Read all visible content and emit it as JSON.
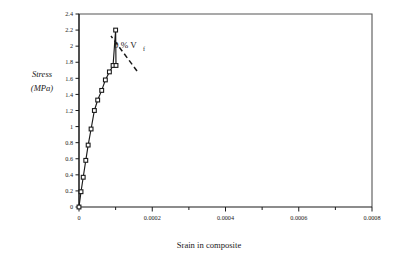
{
  "chart_data": {
    "type": "line",
    "title": "",
    "xlabel": "Srain in composite",
    "ylabel_line1": "Stress",
    "ylabel_line2": "(MPa)",
    "xlim": [
      0,
      0.0008
    ],
    "ylim": [
      0,
      2.4
    ],
    "grid": false,
    "legend": "none",
    "x_major_ticks": [
      0,
      0.0002,
      0.0004,
      0.0006,
      0.0008
    ],
    "x_major_tick_labels": [
      "0",
      "0.0002",
      "0.0004",
      "0.0006",
      "0.0008"
    ],
    "x_minor_ticks": [
      0.0001,
      0.0003,
      0.0005,
      0.0007
    ],
    "y_major_ticks": [
      0,
      0.2,
      0.4,
      0.6,
      0.8,
      1,
      1.2,
      1.4,
      1.6,
      1.8,
      2,
      2.2,
      2.4
    ],
    "y_major_tick_labels": [
      "0",
      "0.2",
      "0.4",
      "0.6",
      "0.8",
      "1",
      "1.2",
      "1.4",
      "1.6",
      "1.8",
      "2",
      "2.2",
      "2.4"
    ],
    "marker": "open-square",
    "line_color": "#1a1a1a",
    "series": [
      {
        "name": "0 % Vf",
        "x": [
          0.0,
          5.5e-06,
          1.15e-05,
          1.85e-05,
          2.5e-05,
          3.3e-05,
          4.2e-05,
          5.1e-05,
          6.2e-05,
          7.2e-05,
          8.3e-05,
          9.3e-05,
          0.0001,
          0.000101
        ],
        "y": [
          0.0,
          0.19,
          0.37,
          0.58,
          0.77,
          0.97,
          1.2,
          1.33,
          1.45,
          1.58,
          1.68,
          1.76,
          2.2,
          1.76
        ]
      }
    ],
    "annotations": [
      {
        "text_main": "0 %  V",
        "text_sub": "f",
        "leader": "dashed",
        "points_to_x": 0.0001,
        "points_to_y": 2.2
      }
    ]
  }
}
